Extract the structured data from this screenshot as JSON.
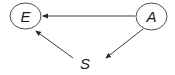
{
  "diagram": {
    "type": "causal-graph",
    "nodes": [
      {
        "id": "E",
        "label": "E",
        "shape": "ellipse",
        "cx": 25.5,
        "cy": 16,
        "rx": 15.5,
        "ry": 13
      },
      {
        "id": "A",
        "label": "A",
        "shape": "ellipse",
        "cx": 151.5,
        "cy": 16.5,
        "rx": 15.5,
        "ry": 13.5
      },
      {
        "id": "S",
        "label": "S",
        "shape": "none",
        "cx": 85,
        "cy": 63
      }
    ],
    "edges": [
      {
        "from": "A",
        "to": "E",
        "x1": 135,
        "y1": 16,
        "x2": 43,
        "y2": 16
      },
      {
        "from": "A",
        "to": "S",
        "x1": 143,
        "y1": 29,
        "x2": 106,
        "y2": 58
      },
      {
        "from": "S",
        "to": "E",
        "x1": 73,
        "y1": 58,
        "x2": 36,
        "y2": 31
      }
    ],
    "colors": {
      "stroke": "#3a3a3a",
      "text": "#1a1a1a",
      "background": "#ffffff"
    }
  }
}
